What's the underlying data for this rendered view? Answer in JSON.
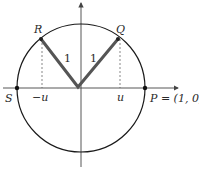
{
  "diagram": {
    "points": {
      "R": {
        "label": "R"
      },
      "Q": {
        "label": "Q"
      },
      "S": {
        "label": "S"
      },
      "P": {
        "label": "P",
        "coord_label": "P = (1, 0)"
      }
    },
    "segment_labels": {
      "left": "1",
      "right": "1"
    },
    "x_ticks": {
      "neg_u": "−u",
      "u": "u"
    },
    "colors": {
      "circle": "#1a1a1a",
      "segments": "#555555",
      "axes": "#444444"
    }
  }
}
